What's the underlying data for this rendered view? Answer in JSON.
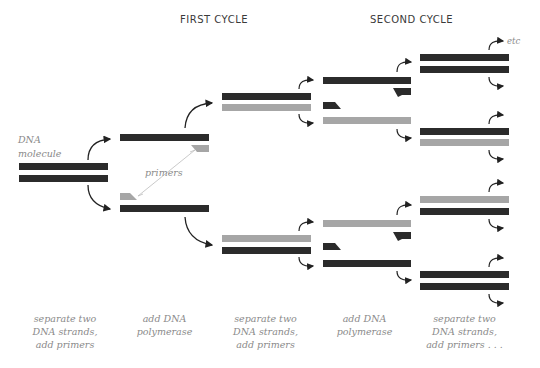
{
  "titles": {
    "first_cycle": "FIRST CYCLE",
    "second_cycle": "SECOND CYCLE"
  },
  "labels": {
    "dna_molecule_line1": "DNA",
    "dna_molecule_line2": "molecule",
    "primers": "primers",
    "etc": "etc"
  },
  "steps": [
    {
      "line1": "separate two",
      "line2": "DNA strands,",
      "line3": "add primers"
    },
    {
      "line1": "add DNA",
      "line2": "polymerase",
      "line3": ""
    },
    {
      "line1": "separate two",
      "line2": "DNA strands,",
      "line3": "add primers"
    },
    {
      "line1": "add DNA",
      "line2": "polymerase",
      "line3": ""
    },
    {
      "line1": "separate two",
      "line2": "DNA strands,",
      "line3": "add primers . . ."
    }
  ],
  "colors": {
    "original_strand": "#2b2b2b",
    "new_strand": "#a6a6a6",
    "text": "#8a8a8a",
    "title": "#3a3a3a"
  }
}
